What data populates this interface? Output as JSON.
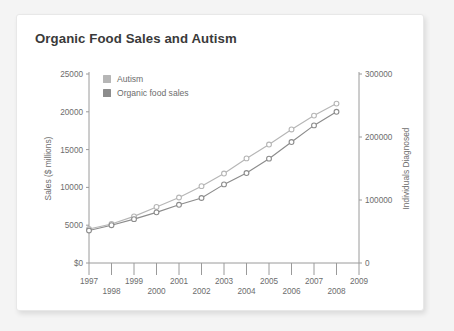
{
  "card": {
    "title": "Organic Food Sales and Autism",
    "background": "#ffffff",
    "page_background": "#f4f4f4"
  },
  "legend": {
    "position": "top-left-inside",
    "items": [
      {
        "label": "Autism",
        "color": "#b6b6b6"
      },
      {
        "label": "Organic food sales",
        "color": "#8c8c8c"
      }
    ]
  },
  "chart_data": {
    "type": "line",
    "title": "Organic Food Sales and Autism",
    "xlabel": "",
    "ylabel": "Sales ($ millions)",
    "y2label": "Individuals Diagnosed",
    "grid": false,
    "legend_position": "top-left-inside",
    "x": [
      1997,
      1998,
      1999,
      2000,
      2001,
      2002,
      2003,
      2004,
      2005,
      2006,
      2007,
      2008
    ],
    "xlim": [
      1997,
      2009
    ],
    "xticks": [
      1997,
      1998,
      1999,
      2000,
      2001,
      2002,
      2003,
      2004,
      2005,
      2006,
      2007,
      2008,
      2009
    ],
    "xticklabels": [
      "1997",
      "1998",
      "1999",
      "2000",
      "2001",
      "2002",
      "2003",
      "2004",
      "2005",
      "2006",
      "2007",
      "2008",
      "2009"
    ],
    "ylim": [
      0,
      25000
    ],
    "yticks": [
      0,
      5000,
      10000,
      15000,
      20000,
      25000
    ],
    "yticklabels": [
      "$0",
      "5000",
      "10000",
      "15000",
      "20000",
      "25000"
    ],
    "y2lim": [
      0,
      300000
    ],
    "y2ticks": [
      0,
      100000,
      200000,
      300000
    ],
    "y2ticklabels": [
      "0",
      "100000",
      "200000",
      "300000"
    ],
    "series": [
      {
        "name": "Autism",
        "color": "#b6b6b6",
        "axis": "right",
        "marker": "open-circle",
        "values": [
          54000,
          62000,
          74000,
          89000,
          104000,
          122000,
          142000,
          166000,
          188000,
          212000,
          234000,
          253000
        ]
      },
      {
        "name": "Organic food sales",
        "color": "#8c8c8c",
        "axis": "left",
        "marker": "open-circle",
        "values": [
          4300,
          5000,
          5800,
          6700,
          7700,
          8600,
          10400,
          11900,
          13800,
          16000,
          18200,
          20000
        ]
      }
    ]
  }
}
